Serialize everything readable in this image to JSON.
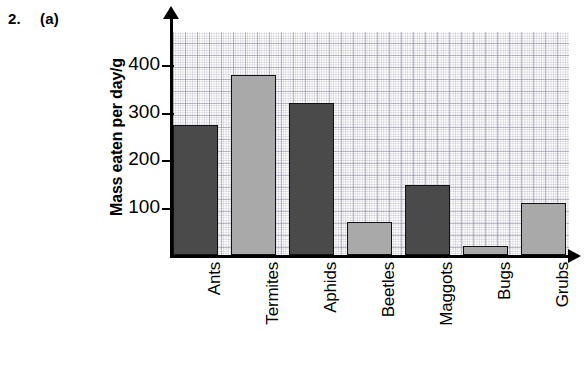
{
  "question": {
    "number": "2.",
    "part": "(a)"
  },
  "chart_data": {
    "type": "bar",
    "title": "",
    "xlabel": "",
    "ylabel": "Mass eaten per day/g",
    "categories": [
      "Ants",
      "Termites",
      "Aphids",
      "Beetles",
      "Maggots",
      "Bugs",
      "Grubs"
    ],
    "values": [
      275,
      380,
      320,
      70,
      148,
      20,
      110
    ],
    "bar_shades": [
      "dark",
      "light",
      "dark",
      "light",
      "dark",
      "light",
      "light"
    ],
    "ylim": [
      0,
      470
    ],
    "y_ticks": [
      100,
      200,
      300,
      400
    ],
    "y_tick_labels": [
      "100",
      "200",
      "300",
      "400"
    ],
    "grid": true,
    "legend": "none",
    "colors": {
      "dark_bar": "#4a4a4a",
      "light_bar": "#a9a9a9",
      "axis": "#000000",
      "grid": "#9a9aad",
      "background": "#ffffff"
    }
  }
}
